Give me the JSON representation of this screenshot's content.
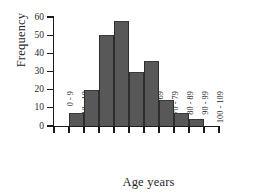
{
  "chart_data": {
    "type": "bar",
    "title": "",
    "subtitle": "",
    "xlabel": "Age years",
    "ylabel": "Frequency",
    "categories": [
      "0 - 9",
      "10 - 19",
      "20 - 29",
      "30 - 39",
      "40 - 49",
      "50 - 59",
      "60 - 69",
      "70 - 79",
      "80 - 89",
      "90 - 99",
      "100 - 109"
    ],
    "values": [
      0,
      7,
      20,
      50,
      58,
      30,
      36,
      14.5,
      7,
      4,
      0
    ],
    "ylim": [
      0,
      60
    ],
    "ytick_labels": [
      "0",
      "10",
      "20",
      "30",
      "40",
      "50",
      "60"
    ],
    "ytick_values": [
      0,
      10,
      20,
      30,
      40,
      50,
      60
    ],
    "grid": false,
    "legend": null,
    "legend_position": "none",
    "bar_color": "#585858",
    "axis_color": "#1a1a1a",
    "background_color": "#ffffff",
    "annotations": []
  },
  "axes": {
    "y_title": "Frequency",
    "x_title": "Age years"
  }
}
